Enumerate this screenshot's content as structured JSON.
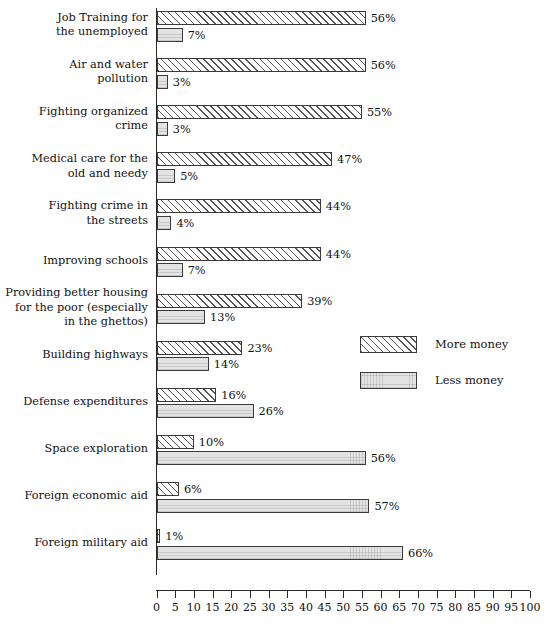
{
  "chart_data": {
    "type": "bar",
    "orientation": "horizontal",
    "title": "",
    "xlabel": "",
    "ylabel": "",
    "xlim": [
      0,
      100
    ],
    "xticks": [
      0,
      5,
      10,
      15,
      20,
      25,
      30,
      35,
      40,
      45,
      50,
      55,
      60,
      65,
      70,
      75,
      80,
      85,
      90,
      95,
      100
    ],
    "grid": false,
    "legend_position": "middle-right",
    "value_suffix": "%",
    "categories": [
      "Job Training for\nthe unemployed",
      "Air and water\npollution",
      "Fighting organized\ncrime",
      "Medical care for the\nold and needy",
      "Fighting crime in\nthe streets",
      "Improving schools",
      "Providing better housing\nfor the poor (especially\nin the ghettos)",
      "Building highways",
      "Defense expenditures",
      "Space exploration",
      "Foreign economic aid",
      "Foreign military aid"
    ],
    "series": [
      {
        "name": "More money",
        "swatch": "hatched",
        "color": "#ffffff",
        "values": [
          56,
          56,
          55,
          47,
          44,
          44,
          39,
          23,
          16,
          10,
          6,
          1
        ],
        "labels": [
          "56%",
          "56%",
          "55%",
          "47%",
          "44%",
          "44%",
          "39%",
          "23%",
          "16%",
          "10%",
          "6%",
          "1%"
        ]
      },
      {
        "name": "Less money",
        "swatch": "solid-gray",
        "color": "#e3e3e3",
        "values": [
          7,
          3,
          3,
          5,
          4,
          7,
          13,
          14,
          26,
          56,
          57,
          66
        ],
        "labels": [
          "7%",
          "3%",
          "3%",
          "5%",
          "4%",
          "7%",
          "13%",
          "14%",
          "26%",
          "56%",
          "57%",
          "66%"
        ]
      }
    ]
  },
  "legend": {
    "items": [
      {
        "label": "More money"
      },
      {
        "label": "Less money"
      }
    ]
  }
}
